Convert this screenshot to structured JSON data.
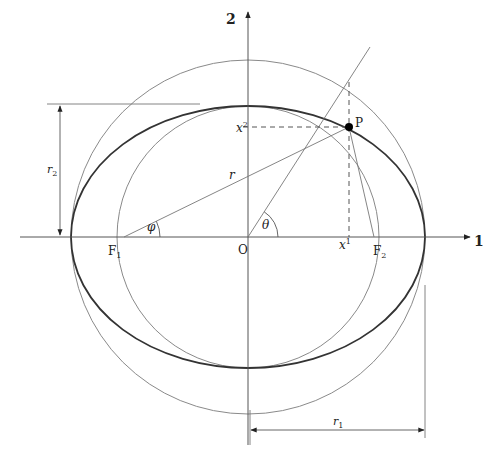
{
  "diagram": {
    "axes": {
      "x_label": "1",
      "y_label": "2"
    },
    "points": {
      "origin": "O",
      "focus_left": "F",
      "focus_left_sub": "1",
      "focus_right": "F",
      "focus_right_sub": "2",
      "point": "P"
    },
    "angles": {
      "phi": "φ",
      "theta": "θ"
    },
    "lengths": {
      "r": "r",
      "r1": "r",
      "r1_sub": "1",
      "r2": "r",
      "r2_sub": "2"
    },
    "coordinates": {
      "x1": "x",
      "x1_sup": "1",
      "x2": "x",
      "x2_sup": "2"
    },
    "geometry": {
      "center": [
        248,
        237
      ],
      "ellipse_semi_major": 177,
      "ellipse_semi_minor": 131,
      "outer_circle_radius": 177,
      "inner_circle_radius": 131,
      "focus_offset": 124,
      "point_P": [
        349,
        127
      ]
    },
    "colors": {
      "ellipse": "#333333",
      "circles": "#888888",
      "axes": "#555555",
      "point": "#000000"
    }
  }
}
